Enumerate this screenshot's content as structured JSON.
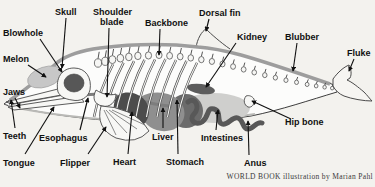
{
  "figure": {
    "credit": "WORLD BOOK illustration by Marian Pahl",
    "background": "#f3f2ee"
  },
  "colors": {
    "label_text": "#101010",
    "leader_line": "#101010",
    "body_fill": "#fcfcfb",
    "body_outline": "#3d3d3d",
    "blubber_band": "#9d9d9d",
    "melon": "#c7c7c7",
    "brain": "#575757",
    "heart": "#4c4c4c",
    "liver": "#8f8f8f",
    "stomach": "#6b6b6b",
    "intestines": "#585858",
    "body_cavity": "#cfcfcd",
    "kidney": "#5d5d5d",
    "bone": "#f7f7f5"
  },
  "labels": [
    {
      "name": "blowhole",
      "lines": [
        {
          "text": "Blowhole",
          "x": 3,
          "y": 36
        }
      ],
      "arrow": {
        "x1": 40,
        "y1": 39,
        "x2": 62,
        "y2": 72
      }
    },
    {
      "name": "skull",
      "lines": [
        {
          "text": "Skull",
          "x": 55,
          "y": 15
        }
      ],
      "arrow": {
        "x1": 66,
        "y1": 18,
        "x2": 62,
        "y2": 68
      }
    },
    {
      "name": "shoulder-blade",
      "lines": [
        {
          "text": "Shoulder",
          "x": 93,
          "y": 15
        },
        {
          "text": "blade",
          "x": 100,
          "y": 25
        }
      ],
      "arrow": {
        "x1": 109,
        "y1": 28,
        "x2": 107,
        "y2": 97
      }
    },
    {
      "name": "backbone",
      "lines": [
        {
          "text": "Backbone",
          "x": 145,
          "y": 26
        }
      ],
      "arrow": {
        "x1": 160,
        "y1": 29,
        "x2": 159,
        "y2": 55
      }
    },
    {
      "name": "dorsal-fin",
      "lines": [
        {
          "text": "Dorsal fin",
          "x": 199,
          "y": 16
        }
      ],
      "arrow": {
        "x1": 209,
        "y1": 19,
        "x2": 206,
        "y2": 31
      }
    },
    {
      "name": "kidney",
      "lines": [
        {
          "text": "Kidney",
          "x": 237,
          "y": 40
        }
      ],
      "arrow": {
        "x1": 236,
        "y1": 43,
        "x2": 206,
        "y2": 87
      }
    },
    {
      "name": "blubber",
      "lines": [
        {
          "text": "Blubber",
          "x": 285,
          "y": 40
        }
      ],
      "arrow": {
        "x1": 297,
        "y1": 43,
        "x2": 293,
        "y2": 71
      }
    },
    {
      "name": "fluke",
      "lines": [
        {
          "text": "Fluke",
          "x": 347,
          "y": 56
        }
      ],
      "arrow": {
        "x1": 354,
        "y1": 59,
        "x2": 349,
        "y2": 71
      }
    },
    {
      "name": "melon",
      "lines": [
        {
          "text": "Melon",
          "x": 3,
          "y": 62
        }
      ],
      "arrow": {
        "x1": 28,
        "y1": 65,
        "x2": 46,
        "y2": 77
      }
    },
    {
      "name": "jaws",
      "lines": [
        {
          "text": "Jaws",
          "x": 3,
          "y": 95
        }
      ],
      "arrow": {
        "x1": 15,
        "y1": 98,
        "x2": 20,
        "y2": 108
      }
    },
    {
      "name": "teeth",
      "lines": [
        {
          "text": "Teeth",
          "x": 3,
          "y": 139
        }
      ],
      "arrow": {
        "x1": 15,
        "y1": 128,
        "x2": 11,
        "y2": 100
      }
    },
    {
      "name": "tongue",
      "lines": [
        {
          "text": "Tongue",
          "x": 3,
          "y": 166
        }
      ],
      "arrow": {
        "x1": 25,
        "y1": 154,
        "x2": 54,
        "y2": 107
      }
    },
    {
      "name": "esophagus",
      "lines": [
        {
          "text": "Esophagus",
          "x": 39,
          "y": 141
        }
      ],
      "arrow": {
        "x1": 80,
        "y1": 130,
        "x2": 88,
        "y2": 98
      }
    },
    {
      "name": "flipper",
      "lines": [
        {
          "text": "Flipper",
          "x": 60,
          "y": 166
        }
      ],
      "arrow": {
        "x1": 88,
        "y1": 154,
        "x2": 106,
        "y2": 127
      }
    },
    {
      "name": "heart",
      "lines": [
        {
          "text": "Heart",
          "x": 113,
          "y": 165
        }
      ],
      "arrow": {
        "x1": 128,
        "y1": 154,
        "x2": 132,
        "y2": 112
      }
    },
    {
      "name": "liver",
      "lines": [
        {
          "text": "Liver",
          "x": 152,
          "y": 140
        }
      ],
      "arrow": {
        "x1": 163,
        "y1": 128,
        "x2": 163,
        "y2": 108
      }
    },
    {
      "name": "stomach",
      "lines": [
        {
          "text": "Stomach",
          "x": 166,
          "y": 165
        }
      ],
      "arrow": {
        "x1": 178,
        "y1": 154,
        "x2": 177,
        "y2": 100
      }
    },
    {
      "name": "intestines",
      "lines": [
        {
          "text": "Intestines",
          "x": 201,
          "y": 141
        }
      ],
      "arrow": {
        "x1": 216,
        "y1": 130,
        "x2": 218,
        "y2": 110
      }
    },
    {
      "name": "anus",
      "lines": [
        {
          "text": "Anus",
          "x": 244,
          "y": 166
        }
      ],
      "arrow": {
        "x1": 249,
        "y1": 155,
        "x2": 248,
        "y2": 121
      }
    },
    {
      "name": "hip-bone",
      "lines": [
        {
          "text": "Hip bone",
          "x": 285,
          "y": 125
        }
      ],
      "arrow": {
        "x1": 291,
        "y1": 119,
        "x2": 252,
        "y2": 101
      }
    }
  ]
}
